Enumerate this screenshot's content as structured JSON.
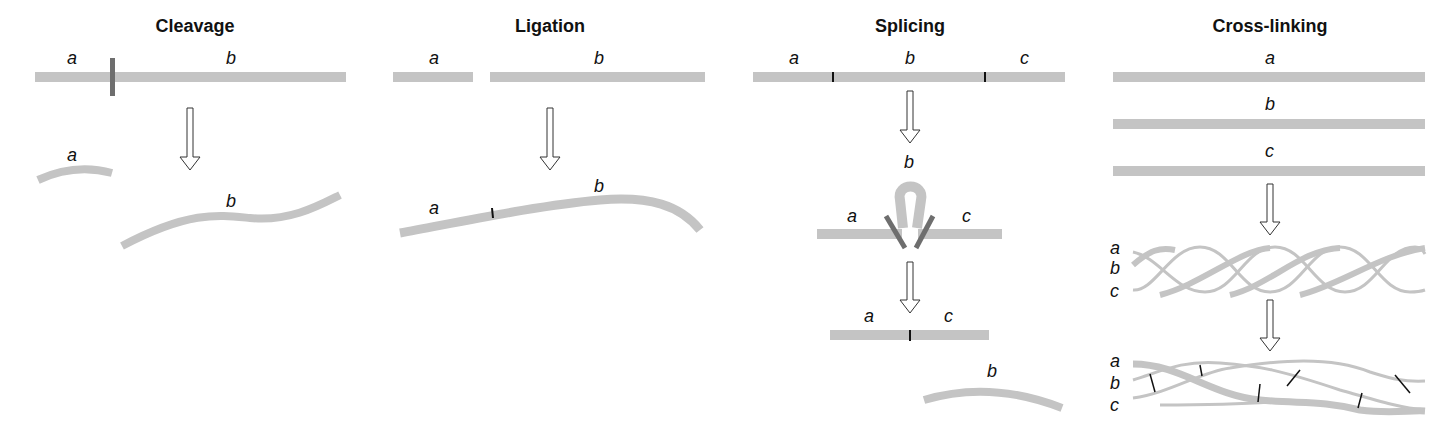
{
  "figure": {
    "panels": [
      {
        "id": "cleavage",
        "title": "Cleavage",
        "labels": {
          "top_a": "a",
          "top_b": "b",
          "bottom_a": "a",
          "bottom_b": "b"
        }
      },
      {
        "id": "ligation",
        "title": "Ligation",
        "labels": {
          "top_a": "a",
          "top_b": "b",
          "bottom_a": "a",
          "bottom_b": "b"
        }
      },
      {
        "id": "splicing",
        "title": "Splicing",
        "labels": {
          "top_a": "a",
          "top_b": "b",
          "top_c": "c",
          "mid_a": "a",
          "mid_b": "b",
          "mid_c": "c",
          "bot_a": "a",
          "bot_c": "c",
          "excised_b": "b"
        }
      },
      {
        "id": "cross-linking",
        "title": "Cross-linking",
        "labels": {
          "top_a": "a",
          "top_b": "b",
          "top_c": "c",
          "helix_a": "a",
          "helix_b": "b",
          "helix_c": "c",
          "xl_a": "a",
          "xl_b": "b",
          "xl_c": "c"
        }
      }
    ],
    "colors": {
      "strand": "#c4c4c4",
      "cut_mark": "#6e6e6e",
      "junction": "#111111",
      "arrow_stroke": "#333333",
      "text": "#111111"
    }
  }
}
